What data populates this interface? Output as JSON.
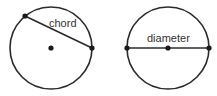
{
  "diagrams": [
    {
      "id": "chord",
      "label": "chord"
    },
    {
      "id": "diameter",
      "label": "diameter"
    }
  ]
}
